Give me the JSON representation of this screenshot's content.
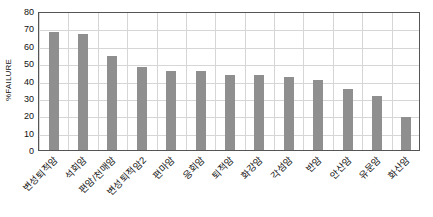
{
  "chart_data": {
    "type": "bar",
    "title": "",
    "xlabel": "",
    "ylabel": "%FAILURE",
    "ylim": [
      0,
      80
    ],
    "ytick_step": 10,
    "yticks": [
      "0",
      "10",
      "20",
      "30",
      "40",
      "50",
      "60",
      "70",
      "80"
    ],
    "grid": true,
    "legend": "none",
    "bar_color": "#8f8f8f",
    "categories": [
      "변성퇴적암",
      "석회암",
      "편암/천매암",
      "변성퇴적암2",
      "편마암",
      "응회암",
      "퇴적암",
      "화강암",
      "각섬암",
      "반암",
      "안산암",
      "유문암",
      "화산암"
    ],
    "values": [
      68,
      67,
      54,
      47.5,
      45.5,
      45.5,
      43,
      43,
      42,
      40.5,
      35,
      31,
      19
    ]
  }
}
